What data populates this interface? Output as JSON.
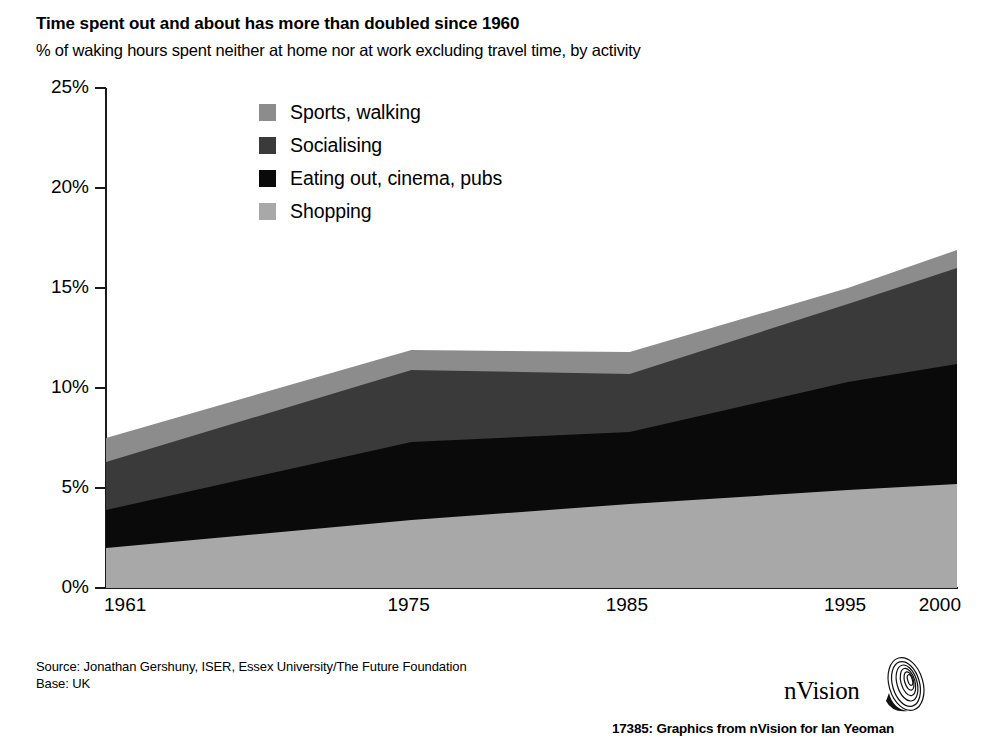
{
  "header": {
    "title": "Time spent out and about has more than doubled since 1960",
    "subtitle": "% of waking hours spent neither at home nor at work excluding travel time, by activity"
  },
  "footer": {
    "source": "Source: Jonathan Gershuny, ISER, Essex University/The Future Foundation",
    "base": "Base: UK",
    "brand": "nVision",
    "brand_mark_icon": "nvision-spiral-icon",
    "credit": "17385: Graphics from  nVision  for Ian Yeoman"
  },
  "chart_data": {
    "type": "area",
    "stacked": true,
    "title": "Time spent out and about has more than doubled since 1960",
    "subtitle": "% of waking hours spent neither at home nor at work excluding travel time, by activity",
    "xlabel": "",
    "ylabel": "",
    "x": [
      1961,
      1975,
      1985,
      1995,
      2000
    ],
    "xtick_labels": [
      "1961",
      "1975",
      "1985",
      "1995",
      "2000"
    ],
    "ytick_labels": [
      "0%",
      "5%",
      "10%",
      "15%",
      "20%",
      "25%"
    ],
    "yticks": [
      0,
      5,
      10,
      15,
      20,
      25
    ],
    "ylim": [
      0,
      25
    ],
    "xlim": [
      1961,
      2000
    ],
    "grid": false,
    "legend_position": "inside-upper-left",
    "series": [
      {
        "name": "Shopping",
        "color": "#a8a8a8",
        "values": [
          2.0,
          3.4,
          4.2,
          4.9,
          5.2
        ]
      },
      {
        "name": "Eating out, cinema, pubs",
        "color": "#0a0a0a",
        "values": [
          1.9,
          3.9,
          3.6,
          5.4,
          6.0
        ]
      },
      {
        "name": "Socialising",
        "color": "#3a3a3a",
        "values": [
          2.4,
          3.6,
          2.9,
          3.9,
          4.8
        ]
      },
      {
        "name": "Sports, walking",
        "color": "#8c8c8c",
        "values": [
          1.2,
          1.0,
          1.1,
          0.8,
          0.9
        ]
      }
    ],
    "stack_tops": {
      "Shopping": [
        2.0,
        3.4,
        4.2,
        4.9,
        5.2
      ],
      "Eating out, cinema, pubs": [
        3.9,
        7.3,
        7.8,
        10.3,
        11.2
      ],
      "Socialising": [
        6.3,
        10.9,
        10.7,
        14.2,
        16.0
      ],
      "Sports, walking": [
        7.5,
        11.9,
        11.8,
        15.0,
        16.9
      ]
    },
    "legend": [
      {
        "label": "Sports, walking",
        "color": "#8c8c8c"
      },
      {
        "label": "Socialising",
        "color": "#3a3a3a"
      },
      {
        "label": "Eating out, cinema, pubs",
        "color": "#0a0a0a"
      },
      {
        "label": "Shopping",
        "color": "#a8a8a8"
      }
    ]
  }
}
